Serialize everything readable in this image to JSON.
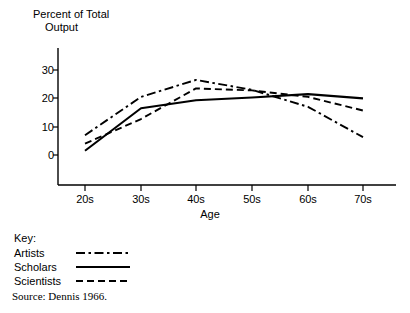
{
  "figure": {
    "y_axis_title_line1": "Percent of Total",
    "y_axis_title_line2": "Output",
    "x_axis_title": "Age",
    "source_note": "Source: Dennis 1966."
  },
  "legend": {
    "heading": "Key:",
    "entries": [
      {
        "label": "Artists",
        "style": "dash-dot"
      },
      {
        "label": "Scholars",
        "style": "solid"
      },
      {
        "label": "Scientists",
        "style": "dashed"
      }
    ]
  },
  "axes": {
    "y_ticks": [
      "0",
      "10",
      "20",
      "30"
    ],
    "x_ticks": [
      "20s",
      "30s",
      "40s",
      "50s",
      "60s",
      "70s"
    ]
  },
  "colors": {
    "line": "#000000",
    "axis": "#000000",
    "background": "#ffffff"
  },
  "chart_data": {
    "type": "line",
    "title": "",
    "subtitle": "",
    "xlabel": "Age",
    "ylabel": "Percent of Total Output",
    "categories": [
      "20s",
      "30s",
      "40s",
      "50s",
      "60s",
      "70s"
    ],
    "ylim": [
      0,
      30
    ],
    "yticks": [
      0,
      10,
      20,
      30
    ],
    "grid": false,
    "legend_position": "below-left",
    "annotations": [
      "Source: Dennis 1966."
    ],
    "series": [
      {
        "name": "Artists",
        "linestyle": "dash-dot",
        "values": [
          7.0,
          20.5,
          26.5,
          23.0,
          17.0,
          6.3
        ]
      },
      {
        "name": "Scholars",
        "linestyle": "solid",
        "values": [
          1.5,
          16.5,
          19.3,
          20.3,
          21.5,
          20.0
        ]
      },
      {
        "name": "Scientists",
        "linestyle": "dashed",
        "values": [
          4.0,
          12.7,
          23.5,
          22.8,
          20.5,
          15.7
        ]
      }
    ]
  }
}
